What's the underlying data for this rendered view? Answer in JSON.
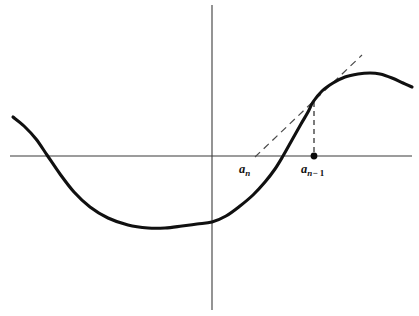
{
  "figure": {
    "kind": "newtons-method-diagram",
    "background_color": "#ffffff",
    "curve_color": "#101010",
    "axis_color": "#3b3b3b",
    "dash_color": "#4a4a4a",
    "width": 419,
    "height": 316
  },
  "axes": {
    "x_axis": {
      "name": "x-axis",
      "y_pixel": 156,
      "x_start": 10,
      "x_end": 412
    },
    "y_axis": {
      "name": "y-axis",
      "x_pixel": 212,
      "y_start": 5,
      "y_end": 310
    }
  },
  "labels": {
    "a_n": {
      "base": "a",
      "sub": "n",
      "text": "aₙ"
    },
    "a_n_minus_1": {
      "base": "a",
      "sub_var": "n",
      "sub_op": "− 1",
      "text": "aₙ₋₁"
    }
  },
  "chart_data": {
    "type": "line",
    "title": "",
    "subtitle": "",
    "xlabel": "",
    "ylabel": "",
    "grid": false,
    "legend": null,
    "axis_origin_px": [
      212,
      156
    ],
    "xlim_px": [
      10,
      412
    ],
    "ylim_px": [
      5,
      310
    ],
    "series": [
      {
        "name": "f(x)",
        "style": "solid-thick",
        "color": "#101010",
        "points_px": [
          [
            13,
            117
          ],
          [
            24,
            126
          ],
          [
            36,
            139
          ],
          [
            47,
            155
          ],
          [
            60,
            174
          ],
          [
            74,
            192
          ],
          [
            90,
            207
          ],
          [
            108,
            218
          ],
          [
            128,
            225
          ],
          [
            148,
            228
          ],
          [
            165,
            228
          ],
          [
            182,
            226
          ],
          [
            197,
            224
          ],
          [
            212,
            222
          ],
          [
            226,
            216
          ],
          [
            240,
            206
          ],
          [
            253,
            195
          ],
          [
            265,
            182
          ],
          [
            275,
            169
          ],
          [
            283,
            156
          ],
          [
            292,
            140
          ],
          [
            301,
            124
          ],
          [
            308,
            112
          ],
          [
            313,
            102
          ],
          [
            322,
            91
          ],
          [
            333,
            83
          ],
          [
            345,
            77
          ],
          [
            358,
            74
          ],
          [
            370,
            73
          ],
          [
            380,
            74
          ],
          [
            392,
            78
          ],
          [
            403,
            83
          ],
          [
            412,
            87
          ]
        ]
      },
      {
        "name": "tangent-at-a-n-minus-1",
        "style": "dashed",
        "color": "#4a4a4a",
        "points_px": [
          [
            255,
            157
          ],
          [
            362,
            55
          ]
        ]
      },
      {
        "name": "drop-line-a-n-minus-1",
        "style": "dashed",
        "color": "#4a4a4a",
        "points_px": [
          [
            314,
            102
          ],
          [
            314,
            156
          ]
        ]
      }
    ],
    "markers": [
      {
        "name": "a-n-minus-1-root-dot",
        "x_px": 314,
        "y_px": 156,
        "radius_px": 3.4,
        "color": "#0a0a0a"
      }
    ],
    "annotations": [
      {
        "name": "a-n-tick-label",
        "text": "aₙ",
        "x_px": 248,
        "y_px": 172
      },
      {
        "name": "a-n-minus-1-tick-label",
        "text": "aₙ₋₁",
        "x_px": 320,
        "y_px": 172
      }
    ],
    "notable_points_px": {
      "curve_left_end": [
        13,
        117
      ],
      "curve_left_root": [
        47,
        156
      ],
      "curve_minimum": [
        165,
        228
      ],
      "curve_y_intercept": [
        212,
        222
      ],
      "curve_right_root": [
        283,
        156
      ],
      "tangency_point": [
        313,
        102
      ],
      "curve_maximum": [
        376,
        73
      ],
      "curve_right_end": [
        412,
        87
      ],
      "tangent_x_intercept": [
        255,
        156
      ]
    }
  }
}
